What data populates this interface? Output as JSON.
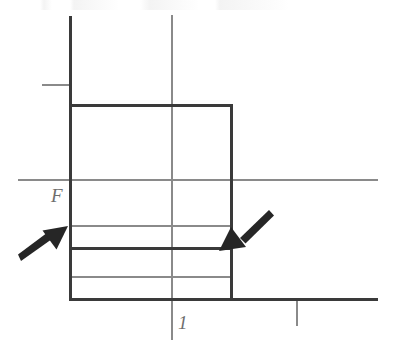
{
  "figure": {
    "type": "technical-diagram",
    "background_color": "#ffffff",
    "line_color_thick": "#3a3a3a",
    "line_color_thin": "#8a8a8a",
    "arrow_color": "#262626",
    "label_color": "#6e6e6e"
  },
  "labels": {
    "force": "F",
    "unit_tick": "1"
  },
  "axes": {
    "vertical_axis": {
      "x": 70,
      "y_top": 16,
      "y_bottom": 300,
      "weight": "thick"
    },
    "horizontal_axis": {
      "y": 300,
      "x_start": 70,
      "x_end": 378,
      "weight": "thick"
    },
    "y_tick": {
      "y": 85,
      "x_start": 42,
      "x_end": 70,
      "weight": "thin"
    },
    "x_tick": {
      "x": 297,
      "y_start": 300,
      "y_end": 325,
      "weight": "thin"
    },
    "center_line": {
      "x": 172,
      "y_start": 15,
      "y_end": 340,
      "weight": "thin"
    }
  },
  "block": {
    "x_left": 70,
    "x_right": 232,
    "y_top": 105,
    "y_bottom": 300,
    "weight": "thick"
  },
  "division_lines": [
    {
      "name": "upper-gauge-line",
      "y": 180,
      "x_start": 18,
      "x_end": 378,
      "weight": "thin"
    },
    {
      "name": "mid-gauge-line",
      "y": 226,
      "x_start": 70,
      "x_end": 232,
      "weight": "thin"
    },
    {
      "name": "force-level-line",
      "y": 248,
      "x_start": 70,
      "x_end": 232,
      "weight": "thick"
    },
    {
      "name": "lower-gauge-line",
      "y": 277,
      "x_start": 70,
      "x_end": 232,
      "weight": "thin"
    }
  ],
  "arrows": [
    {
      "name": "left-force-arrow",
      "direction": "up-right",
      "tail": {
        "x": 22,
        "y": 259
      },
      "tip": {
        "x": 67,
        "y": 227
      }
    },
    {
      "name": "right-force-arrow",
      "direction": "down-left",
      "tail": {
        "x": 268,
        "y": 212
      },
      "tip": {
        "x": 220,
        "y": 250
      }
    }
  ]
}
